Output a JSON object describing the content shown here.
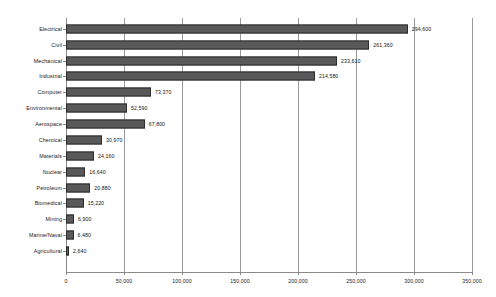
{
  "chart_data": {
    "type": "bar",
    "orientation": "horizontal",
    "title": "",
    "subtitle": "",
    "xlabel": "",
    "ylabel": "",
    "xlim": [
      0,
      350000
    ],
    "grid": true,
    "legend": null,
    "legend_position": "none",
    "tick_interval": 50000,
    "xticks": [
      0,
      50000,
      100000,
      150000,
      200000,
      250000,
      300000,
      350000
    ],
    "xtick_labels": [
      "0",
      "50,000",
      "100,000",
      "150,000",
      "200,000",
      "250,000",
      "300,000",
      "350,000"
    ],
    "categories": [
      "Electrical",
      "Civil",
      "Mechanical",
      "Industrial",
      "Computer",
      "Environmental",
      "Aerospace",
      "Chemical",
      "Materials",
      "Nuclear",
      "Petroleum",
      "Biomedical",
      "Mining",
      "Marine/Naval",
      "Agricultural"
    ],
    "values": [
      294600,
      261360,
      233610,
      214580,
      73370,
      52590,
      67800,
      30970,
      24160,
      16640,
      20880,
      15220,
      6900,
      6480,
      2640
    ],
    "value_labels": [
      "294,600",
      "261,360",
      "233,610",
      "214,580",
      "73,370",
      "52,590",
      "67,800",
      "30,970",
      "24,160",
      "16,640",
      "20,880",
      "15,220",
      "6,900",
      "6,480",
      "2,640"
    ],
    "colors": {
      "bar_fill": "#595959",
      "bar_border": "#2b2b2b",
      "gridline": "#9a9a9a",
      "axis": "#8a8a8a",
      "text": "#1a1a1a",
      "background": "#ffffff"
    }
  }
}
